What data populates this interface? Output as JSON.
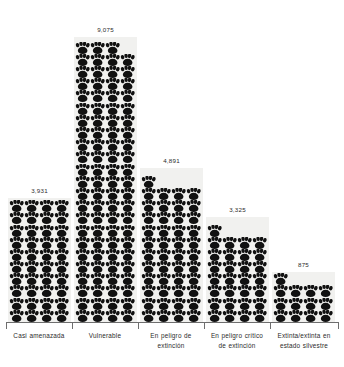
{
  "chart_data": {
    "type": "bar",
    "subtype": "pictogram",
    "title": "",
    "subtitle": "",
    "xlabel": "",
    "ylabel": "",
    "grid": false,
    "legend": false,
    "icon": "paw-print-icon",
    "icon_unit_note": "each paw icon represents approximately 227 species",
    "categories": [
      "Casi amenazada",
      "Vulnerable",
      "En peligro de extinción",
      "En peligro crítico de extinción",
      "Extinta/extinta en estado silvestre"
    ],
    "values": [
      3931,
      9075,
      4891,
      3325,
      875
    ],
    "value_labels": [
      "3,931",
      "9,075",
      "4,891",
      "3,325",
      "875"
    ],
    "ylim": [
      0,
      9075
    ],
    "colors": {
      "icon": "#111111",
      "bar_background": "#f1f1ef",
      "axis": "#6e6e6e",
      "text": "#2b2b2b",
      "page_background": "#ffffff"
    }
  },
  "bars": [
    {
      "name": "casi-amenazada",
      "label": "Casi amenazada",
      "value_label": "3,931",
      "left": 8,
      "width": 63,
      "bar_height": 124,
      "full_rows": 9,
      "top_row_count": 4,
      "cols": 4
    },
    {
      "name": "vulnerable",
      "label": "Vulnerable",
      "value_label": "9,075",
      "left": 74,
      "width": 63,
      "bar_height": 285,
      "full_rows": 22,
      "top_row_count": 3,
      "cols": 4
    },
    {
      "name": "en-peligro-de-extincion",
      "label": "En peligro de extinción",
      "value_label": "4,891",
      "left": 140,
      "width": 63,
      "bar_height": 154,
      "full_rows": 11,
      "top_row_count": 1,
      "cols": 4
    },
    {
      "name": "en-peligro-critico-de-extincion",
      "label": "En peligro crítico de extinción",
      "value_label": "3,325",
      "left": 206,
      "width": 63,
      "bar_height": 105,
      "full_rows": 7,
      "top_row_count": 1,
      "cols": 4
    },
    {
      "name": "extinta-extinta-en-estado-silvestre",
      "label": "Extinta/extinta en estado silvestre",
      "value_label": "875",
      "left": 272,
      "width": 63,
      "bar_height": 50,
      "full_rows": 3,
      "top_row_count": 1,
      "cols": 4
    }
  ],
  "axis": {
    "ticks_x": [
      6,
      72,
      138,
      204,
      270,
      338
    ],
    "labels": [
      {
        "name": "casi-amenazada",
        "text": "Casi amenazada",
        "left": 8,
        "width": 62
      },
      {
        "name": "vulnerable",
        "text": "Vulnerable",
        "left": 74,
        "width": 62
      },
      {
        "name": "en-peligro-de-extincion",
        "text": "En peligro de extinción",
        "left": 140,
        "width": 62
      },
      {
        "name": "en-peligro-critico-de-extincion",
        "text": "En peligro crítico de extinción",
        "left": 206,
        "width": 62
      },
      {
        "name": "extinta-extinta-en-estado-silvestre",
        "text": "Extinta/extinta en estado silvestre",
        "left": 272,
        "width": 64
      }
    ]
  }
}
